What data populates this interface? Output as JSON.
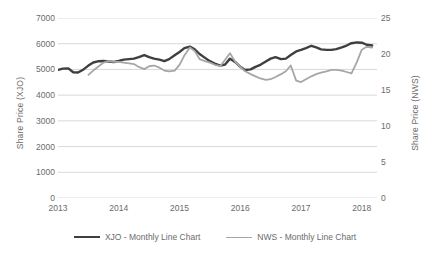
{
  "chart_data": {
    "type": "line",
    "title": "",
    "xlabel": "",
    "ylabel": "Share Price (XJO)",
    "y2label": "Share Price (NWS)",
    "grid": true,
    "legend_position": "bottom",
    "xlim": [
      2013,
      2018.25
    ],
    "x_ticks": [
      "2013",
      "2014",
      "2015",
      "2016",
      "2017",
      "2018"
    ],
    "x_tick_values": [
      2013,
      2014,
      2015,
      2016,
      2017,
      2018
    ],
    "ylim": [
      0,
      7000
    ],
    "y_ticks": [
      "0",
      "1000",
      "2000",
      "3000",
      "4000",
      "5000",
      "6000",
      "7000"
    ],
    "y_tick_values": [
      0,
      1000,
      2000,
      3000,
      4000,
      5000,
      6000,
      7000
    ],
    "y2lim": [
      0,
      25
    ],
    "y2_ticks": [
      "0",
      "5",
      "10",
      "15",
      "20",
      "25"
    ],
    "y2_tick_values": [
      0,
      5,
      10,
      15,
      20,
      25
    ],
    "series": [
      {
        "name": "XJO - Monthly Line Chart",
        "axis": "left",
        "color": "#3f3f3f",
        "x": [
          2013.0,
          2013.08,
          2013.17,
          2013.25,
          2013.33,
          2013.42,
          2013.5,
          2013.58,
          2013.67,
          2013.75,
          2013.83,
          2013.92,
          2014.0,
          2014.08,
          2014.17,
          2014.25,
          2014.33,
          2014.42,
          2014.5,
          2014.58,
          2014.67,
          2014.75,
          2014.83,
          2014.92,
          2015.0,
          2015.08,
          2015.17,
          2015.25,
          2015.33,
          2015.42,
          2015.5,
          2015.58,
          2015.67,
          2015.75,
          2015.83,
          2015.92,
          2016.0,
          2016.08,
          2016.17,
          2016.25,
          2016.33,
          2016.42,
          2016.5,
          2016.58,
          2016.67,
          2016.75,
          2016.83,
          2016.92,
          2017.0,
          2017.08,
          2017.17,
          2017.25,
          2017.33,
          2017.42,
          2017.5,
          2017.58,
          2017.67,
          2017.75,
          2017.83,
          2017.92,
          2018.0,
          2018.08,
          2018.17
        ],
        "values": [
          4980,
          5030,
          5040,
          4890,
          4880,
          5000,
          5150,
          5270,
          5320,
          5330,
          5310,
          5290,
          5330,
          5380,
          5400,
          5420,
          5480,
          5560,
          5480,
          5420,
          5380,
          5320,
          5400,
          5550,
          5680,
          5830,
          5890,
          5780,
          5600,
          5450,
          5320,
          5230,
          5150,
          5190,
          5420,
          5280,
          5100,
          4980,
          5000,
          5100,
          5180,
          5310,
          5420,
          5480,
          5400,
          5420,
          5560,
          5700,
          5760,
          5830,
          5920,
          5860,
          5780,
          5760,
          5760,
          5790,
          5860,
          5930,
          6020,
          6050,
          6040,
          5960,
          5930
        ]
      },
      {
        "name": "NWS - Monthly Line Chart",
        "axis": "right",
        "color": "#a6a6a6",
        "x": [
          2013.5,
          2013.58,
          2013.67,
          2013.75,
          2013.83,
          2013.92,
          2014.0,
          2014.08,
          2014.17,
          2014.25,
          2014.33,
          2014.42,
          2014.5,
          2014.58,
          2014.67,
          2014.75,
          2014.83,
          2014.92,
          2015.0,
          2015.08,
          2015.17,
          2015.25,
          2015.33,
          2015.42,
          2015.5,
          2015.58,
          2015.67,
          2015.75,
          2015.83,
          2015.92,
          2016.0,
          2016.08,
          2016.17,
          2016.25,
          2016.33,
          2016.42,
          2016.5,
          2016.58,
          2016.67,
          2016.75,
          2016.83,
          2016.92,
          2017.0,
          2017.08,
          2017.17,
          2017.25,
          2017.33,
          2017.42,
          2017.5,
          2017.58,
          2017.67,
          2017.75,
          2017.83,
          2017.92,
          2018.0,
          2018.08,
          2018.17
        ],
        "values": [
          17.1,
          17.7,
          18.3,
          18.8,
          19.0,
          18.9,
          18.9,
          18.8,
          18.7,
          18.6,
          18.2,
          17.9,
          18.3,
          18.4,
          18.1,
          17.7,
          17.6,
          17.7,
          18.5,
          19.8,
          20.9,
          20.4,
          19.3,
          19.0,
          18.8,
          18.5,
          18.3,
          19.2,
          20.1,
          18.9,
          18.2,
          17.6,
          17.2,
          16.9,
          16.6,
          16.4,
          16.5,
          16.8,
          17.2,
          17.6,
          18.4,
          16.3,
          16.1,
          16.5,
          16.9,
          17.2,
          17.4,
          17.6,
          17.8,
          17.8,
          17.7,
          17.5,
          17.3,
          18.9,
          20.6,
          21.0,
          20.9
        ]
      }
    ]
  },
  "legend": {
    "items": [
      {
        "label": "XJO - Monthly Line Chart"
      },
      {
        "label": "NWS - Monthly Line Chart"
      }
    ]
  }
}
